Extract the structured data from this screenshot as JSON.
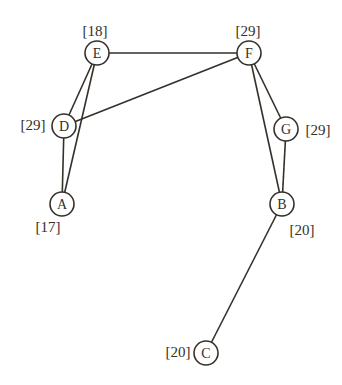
{
  "diagram": {
    "type": "graph",
    "background": "#ffffff",
    "ink_color": "#35302a",
    "stroke_width": 1.6,
    "node_radius": 12,
    "nodes": [
      {
        "id": "E",
        "label": "E",
        "value": "[18]",
        "x": 97,
        "y": 53,
        "value_x": 95,
        "value_y": 31
      },
      {
        "id": "F",
        "label": "F",
        "value": "[29]",
        "x": 249,
        "y": 53,
        "value_x": 248,
        "value_y": 31
      },
      {
        "id": "D",
        "label": "D",
        "value": "[29]",
        "x": 64,
        "y": 126,
        "value_x": 33,
        "value_y": 125
      },
      {
        "id": "G",
        "label": "G",
        "value": "[29]",
        "x": 286,
        "y": 129,
        "value_x": 318,
        "value_y": 130
      },
      {
        "id": "A",
        "label": "A",
        "value": "[17]",
        "x": 62,
        "y": 204,
        "value_x": 48,
        "value_y": 227
      },
      {
        "id": "B",
        "label": "B",
        "value": "[20]",
        "x": 282,
        "y": 204,
        "value_x": 302,
        "value_y": 230
      },
      {
        "id": "C",
        "label": "C",
        "value": "[20]",
        "x": 206,
        "y": 353,
        "value_x": 178,
        "value_y": 352
      }
    ],
    "edges": [
      {
        "from": "E",
        "to": "F"
      },
      {
        "from": "E",
        "to": "D"
      },
      {
        "from": "E",
        "to": "A"
      },
      {
        "from": "D",
        "to": "F"
      },
      {
        "from": "D",
        "to": "A"
      },
      {
        "from": "F",
        "to": "G"
      },
      {
        "from": "F",
        "to": "B"
      },
      {
        "from": "G",
        "to": "B"
      },
      {
        "from": "B",
        "to": "C"
      }
    ]
  }
}
